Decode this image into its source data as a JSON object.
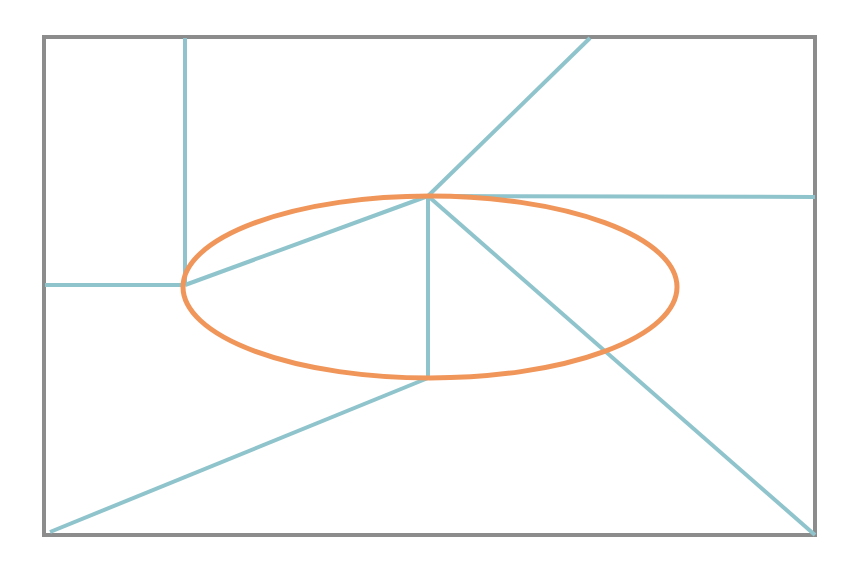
{
  "figure": {
    "kind": "geometric-line-diagram",
    "canvas": {
      "width": 854,
      "height": 571,
      "background": "#ffffff"
    },
    "colors": {
      "border_gray": "#8c8c8c",
      "edge_teal": "#8fc4cc",
      "ellipse_orange": "#f0965a",
      "background_white": "#ffffff"
    },
    "stroke_widths": {
      "border": 4,
      "edge": 4,
      "ellipse": 5
    },
    "bounding_box": {
      "label": "outer-rectangle",
      "x": 44,
      "y": 37,
      "width": 771,
      "height": 498,
      "stroke": "#8c8c8c"
    },
    "ellipse": {
      "label": "orange-ellipse",
      "cx": 430,
      "cy": 287,
      "rx": 247,
      "ry": 91,
      "stroke": "#f0965a"
    },
    "nodes": [
      {
        "name": "hub-node",
        "x": 428,
        "y": 196
      },
      {
        "name": "left-junction-node",
        "x": 185,
        "y": 285
      },
      {
        "name": "lower-vertex-node",
        "x": 428,
        "y": 378
      }
    ],
    "edges": [
      {
        "name": "edge-hub-to-top-right",
        "x1": 428,
        "y1": 196,
        "x2": 590,
        "y2": 38
      },
      {
        "name": "edge-hub-to-right-border",
        "x1": 428,
        "y1": 196,
        "x2": 815,
        "y2": 197
      },
      {
        "name": "edge-hub-to-bottom-right-corner",
        "x1": 428,
        "y1": 196,
        "x2": 815,
        "y2": 535
      },
      {
        "name": "edge-hub-to-lower-vertex",
        "x1": 428,
        "y1": 196,
        "x2": 428,
        "y2": 378
      },
      {
        "name": "edge-lower-vertex-to-bottom-left",
        "x1": 428,
        "y1": 378,
        "x2": 50,
        "y2": 532
      },
      {
        "name": "edge-hub-to-left-junction",
        "x1": 428,
        "y1": 196,
        "x2": 185,
        "y2": 285
      },
      {
        "name": "edge-left-junction-to-left-border",
        "x1": 185,
        "y1": 285,
        "x2": 45,
        "y2": 285
      },
      {
        "name": "edge-left-junction-to-top-border",
        "x1": 185,
        "y1": 285,
        "x2": 185,
        "y2": 38
      }
    ]
  }
}
